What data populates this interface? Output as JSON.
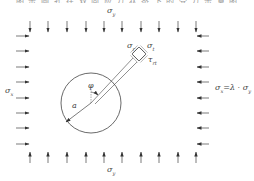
{
  "caption_partial": "图 示 圆 孔 在 双 向 应 力 状 态 下 的 受 力 示 意 图",
  "labels": {
    "sigma_y_top": {
      "base": "σ",
      "sub": "y"
    },
    "sigma_y_bottom": {
      "base": "σ",
      "sub": "y"
    },
    "sigma_x_left": {
      "base": "σ",
      "sub": "x"
    },
    "sigma_x_right": {
      "base": "σ",
      "sub": "x",
      "rest": "=λ · σ",
      "rest_sub": "y"
    },
    "sigma_r": {
      "base": "σ",
      "sub": "r"
    },
    "sigma_t": {
      "base": "σ",
      "sub": "t"
    },
    "tau_rt": {
      "base": "τ",
      "sub": "rt"
    },
    "radius": "a",
    "angle": "φ"
  },
  "geometry": {
    "top_arrows_x": [
      30,
      48,
      67,
      86,
      104,
      122,
      141,
      159,
      178,
      196
    ],
    "side_arrows_y": [
      36,
      51,
      67,
      82,
      98,
      113,
      128,
      144
    ],
    "hole_center": [
      91,
      103
    ],
    "hole_radius": 30,
    "element_center": [
      139,
      54
    ]
  },
  "colors": {
    "line": "#333333",
    "text": "#444444"
  }
}
